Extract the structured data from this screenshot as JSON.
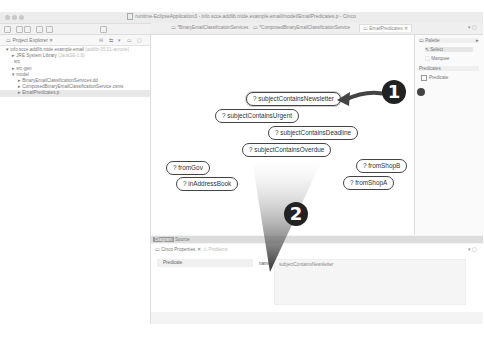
{
  "window": {
    "title": "runtime-EclipseApplication3 - info.scce.addlib.mide.example.email/model/EmailPredicates.p - Cinco"
  },
  "toolbar": {
    "zoom_level": "100%"
  },
  "project_explorer": {
    "title": "Project Explorer",
    "tree": [
      {
        "label": "info.scce.addlib.mide.example.email",
        "suffix": "[addlib-05.01-annote]",
        "level": 0
      },
      {
        "label": "JRE System Library",
        "suffix": "[JavaSE-1.8]",
        "level": 1
      },
      {
        "label": "src",
        "level": 1
      },
      {
        "label": "src-gen",
        "level": 1
      },
      {
        "label": "model",
        "level": 1
      },
      {
        "label": "BinaryEmailClassificationServices.dd",
        "level": 2
      },
      {
        "label": "ComposedBinaryEmailClassificationService.csms",
        "level": 2
      },
      {
        "label": "EmailPredicates.p",
        "level": 2,
        "selected": true
      }
    ]
  },
  "editor": {
    "tabs": [
      {
        "label": "*BinaryEmailClassificationServices",
        "active": false
      },
      {
        "label": "*ComposedBinaryEmailClassificationService",
        "active": false
      },
      {
        "label": "EmailPredicates",
        "active": true
      }
    ],
    "nodes": [
      {
        "label": "? subjectContainsNewsletter",
        "selected": true
      },
      {
        "label": "? subjectContainsUrgent"
      },
      {
        "label": "? subjectContainsDeadline"
      },
      {
        "label": "? subjectContainsOverdue"
      },
      {
        "label": "? fromGov"
      },
      {
        "label": "? inAddressBook"
      },
      {
        "label": "? fromShopB"
      },
      {
        "label": "? fromShopA"
      }
    ],
    "view_tabs": [
      "Diagram",
      "Source"
    ]
  },
  "palette": {
    "title": "Palette",
    "tools": [
      "Select",
      "Marquee"
    ],
    "group": "Predicates",
    "items": [
      "Predicate"
    ]
  },
  "properties": {
    "title": "Cinco Properties",
    "other_tab": "Problems",
    "section": "Predicate",
    "field_label": "name",
    "field_value": "subjectContainsNewsletter"
  },
  "callouts": [
    "1",
    "2"
  ]
}
